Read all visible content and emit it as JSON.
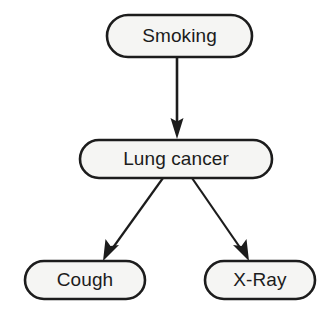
{
  "diagram": {
    "type": "bayesian-network",
    "background_color": "#ffffff",
    "node_fill_color": "#f5f5f3",
    "node_stroke_color": "#1c1c1c",
    "edge_color": "#1c1c1c",
    "text_color": "#1c1c1c",
    "nodes": [
      {
        "id": "smoking",
        "label": "Smoking",
        "shape": "stadium",
        "x": 107,
        "y": 15,
        "width": 145,
        "height": 42
      },
      {
        "id": "lung_cancer",
        "label": "Lung cancer",
        "shape": "stadium",
        "x": 80,
        "y": 140,
        "width": 192,
        "height": 38
      },
      {
        "id": "cough",
        "label": "Cough",
        "shape": "stadium",
        "x": 25,
        "y": 261,
        "width": 120,
        "height": 38
      },
      {
        "id": "xray",
        "label": "X-Ray",
        "shape": "stadium",
        "x": 205,
        "y": 261,
        "width": 110,
        "height": 38
      }
    ],
    "edges": [
      {
        "id": "smoking-to-lung-cancer",
        "from": "smoking",
        "to": "lung_cancer",
        "direction": "down",
        "x1": 177,
        "y1": 57,
        "x2": 177,
        "y2": 139
      },
      {
        "id": "lung-cancer-to-cough",
        "from": "lung_cancer",
        "to": "cough",
        "direction": "down-left",
        "x1": 163,
        "y1": 178,
        "x2": 105,
        "y2": 259
      },
      {
        "id": "lung-cancer-to-xray",
        "from": "lung_cancer",
        "to": "xray",
        "direction": "down-right",
        "x1": 192,
        "y1": 178,
        "x2": 247,
        "y2": 259
      }
    ]
  }
}
